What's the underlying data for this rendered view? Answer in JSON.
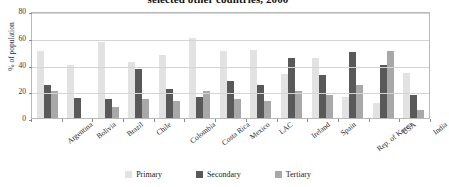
{
  "chart_data": {
    "type": "bar",
    "title": "selected other countries, 2000",
    "xlabel": "",
    "ylabel": "% of population",
    "ylim": [
      0,
      80
    ],
    "yticks": [
      0,
      20,
      40,
      60,
      80
    ],
    "grid": true,
    "legend_position": "bottom",
    "categories": [
      "Argentina",
      "Bolivia",
      "Brazil",
      "Chile",
      "Colombia",
      "Costa Rica",
      "Mexico",
      "LAC",
      "Ireland",
      "Spain",
      "Rep. of Korea",
      "USA",
      "India"
    ],
    "series": [
      {
        "name": "Primary",
        "color": "#e2e2e2",
        "values": [
          50,
          40,
          57,
          42,
          47,
          60,
          50,
          51,
          33,
          45,
          16,
          11,
          34
        ]
      },
      {
        "name": "Secondary",
        "color": "#595959",
        "values": [
          25,
          15,
          14,
          37,
          22,
          16,
          28,
          25,
          45,
          32,
          49,
          40,
          17
        ]
      },
      {
        "name": "Tertiary",
        "color": "#a8a8a8",
        "values": [
          20,
          0,
          8,
          14,
          13,
          20,
          14,
          13,
          20,
          17,
          25,
          50,
          6
        ]
      }
    ]
  }
}
